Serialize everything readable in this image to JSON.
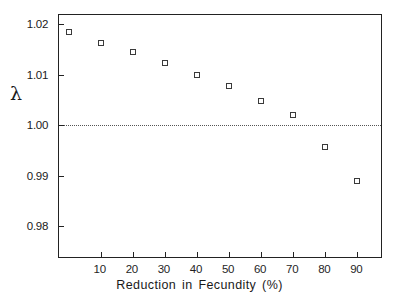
{
  "chart_data": {
    "type": "scatter",
    "title": "",
    "xlabel": "Reduction in Fecundity (%)",
    "ylabel": "λ",
    "x": [
      0,
      10,
      20,
      30,
      40,
      50,
      60,
      70,
      80,
      90
    ],
    "values": [
      1.0185,
      1.0163,
      1.0145,
      1.0123,
      1.0099,
      1.0078,
      1.0048,
      1.002,
      0.9956,
      0.9889
    ],
    "series": [
      {
        "name": "lambda",
        "values": [
          1.0185,
          1.0163,
          1.0145,
          1.0123,
          1.0099,
          1.0078,
          1.0048,
          1.002,
          0.9956,
          0.9889
        ]
      }
    ],
    "xlim": [
      -3,
      98
    ],
    "ylim": [
      0.9735,
      1.0218
    ],
    "xticks": [
      10,
      20,
      30,
      40,
      50,
      60,
      70,
      80,
      90
    ],
    "xtick_labels": [
      "10",
      "20",
      "30",
      "40",
      "50",
      "60",
      "70",
      "80",
      "90"
    ],
    "yticks": [
      0.98,
      0.99,
      1.0,
      1.01,
      1.02
    ],
    "ytick_labels": [
      "0.98",
      "0.99",
      "1.00",
      "1.01",
      "1.02"
    ],
    "grid": false,
    "legend": null,
    "annotations": [
      {
        "type": "horizontal-reference-line",
        "value": 1.0,
        "style": "dotted",
        "color": "#555555"
      }
    ],
    "marker_style": "open-square",
    "marker_color": "#3a3a3a",
    "axis_color": "#222222",
    "background": "#ffffff"
  }
}
